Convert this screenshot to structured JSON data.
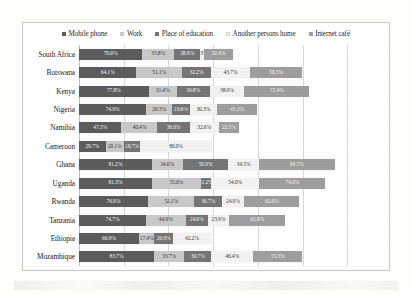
{
  "legend": {
    "items": [
      {
        "label": "Mobile phone",
        "color": "#5c5c5c",
        "marker": "square-marker"
      },
      {
        "label": "Work",
        "color": "#c9c9c9",
        "marker": "square-marker"
      },
      {
        "label": "Place of education",
        "color": "#757575",
        "marker": "square-marker"
      },
      {
        "label": "Another persons home",
        "color": "#f2f2f2",
        "marker": "square-marker"
      },
      {
        "label": "Internet café",
        "color": "#9e9e9e",
        "marker": "square-marker"
      }
    ]
  },
  "chart_data": {
    "type": "bar",
    "orientation": "horizontal",
    "stacked": true,
    "title": "",
    "subtitle": "",
    "xlabel": "",
    "ylabel": "",
    "xlim": [
      0,
      340
    ],
    "grid": true,
    "gridline_values": [
      0,
      50,
      100,
      150,
      200,
      250,
      300
    ],
    "legend_position": "top",
    "categories": [
      "South Africa",
      "Botswana",
      "Kenya",
      "Nigeria",
      "Namibia",
      "Cameroon",
      "Ghana",
      "Uganda",
      "Rwanda",
      "Tanzania",
      "Ethiopia",
      "Mozambique"
    ],
    "series": [
      {
        "name": "Mobile phone",
        "color": "#5c5c5c",
        "values": [
          70.6,
          64.1,
          77.8,
          74.9,
          47.3,
          29.7,
          81.2,
          81.3,
          76.9,
          74.7,
          66.9,
          83.7
        ]
      },
      {
        "name": "Work",
        "color": "#c9c9c9",
        "values": [
          35.8,
          51.1,
          31.4,
          29.3,
          40.4,
          20.1,
          34.6,
          55.0,
          52.1,
          44.6,
          17.4,
          33.7
        ]
      },
      {
        "name": "Place of education",
        "color": "#757575",
        "values": [
          28.9,
          32.2,
          36.8,
          19.6,
          36.0,
          18.7,
          50.9,
          11.2,
          30.7,
          24.6,
          20.9,
          30.7
        ]
      },
      {
        "name": "Another persons home",
        "color": "#f2f2f2",
        "values": [
          4.3,
          43.7,
          38.9,
          30.3,
          32.6,
          80.0,
          34.5,
          54.0,
          24.9,
          23.9,
          42.2,
          46.4
        ]
      },
      {
        "name": "Internet café",
        "color": "#9e9e9e",
        "values": [
          32.4,
          58.3,
          72.4,
          45.1,
          22.5,
          0,
          84.7,
          74.0,
          62.0,
          62.8,
          0,
          55.3
        ]
      }
    ],
    "labels": [
      [
        "70.6%",
        "35.8%",
        "28.9%",
        "4.3%",
        "32.4%"
      ],
      [
        "64.1%",
        "51.1%",
        "32.2%",
        "43.7%",
        "58.3%"
      ],
      [
        "77.8%",
        "31.4%",
        "36.8%",
        "38.9%",
        "72.4%"
      ],
      [
        "74.9%",
        "29.3%",
        "19.6%",
        "30.3%",
        "45.1%"
      ],
      [
        "47.3%",
        "40.4%",
        "36.0%",
        "32.6%",
        "22.5%"
      ],
      [
        "29.7%",
        "20.1%",
        "18.7%",
        "80.0%",
        ""
      ],
      [
        "81.2%",
        "34.6%",
        "50.9%",
        "34.5%",
        "84.7%"
      ],
      [
        "81.3%",
        "55.0%",
        "11.2%",
        "54.0%",
        "74.0%"
      ],
      [
        "76.9%",
        "52.1%",
        "30.7%",
        "24.9%",
        "62.0%"
      ],
      [
        "74.7%",
        "44.6%",
        "24.6%",
        "23.9%",
        "62.8%"
      ],
      [
        "66.9%",
        "17.4%",
        "20.9%",
        "42.2%",
        ""
      ],
      [
        "83.7%",
        "33.7%",
        "30.7%",
        "46.4%",
        "55.3%"
      ]
    ]
  }
}
